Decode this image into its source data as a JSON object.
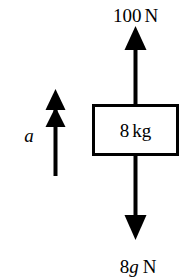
{
  "diagram": {
    "type": "free-body-force-diagram",
    "background_color": "#ffffff",
    "ink_color": "#000000",
    "body": {
      "label": "8 kg",
      "mass_value": "8",
      "mass_unit": "kg",
      "shape": "rectangle"
    },
    "forces": [
      {
        "name": "applied-force-up",
        "label": "100 N",
        "magnitude": "100",
        "unit": "N",
        "direction": "up",
        "arrowhead": "single",
        "position": "above-box"
      },
      {
        "name": "weight-force-down",
        "label": "8g N",
        "magnitude_prefix": "8",
        "magnitude_italic": "g",
        "unit": "N",
        "direction": "down",
        "arrowhead": "single",
        "position": "below-box"
      }
    ],
    "acceleration": {
      "name": "acceleration-vector",
      "label": "a",
      "direction": "up",
      "arrowhead": "double",
      "position": "left-of-box"
    }
  }
}
